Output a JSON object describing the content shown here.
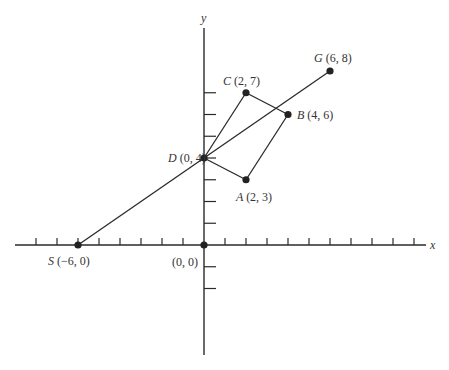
{
  "chart_data": {
    "type": "scatter",
    "title": "",
    "xlabel": "x",
    "ylabel": "y",
    "origin_label": "(0, 0)",
    "xlim": [
      -9,
      10
    ],
    "ylim": [
      -5,
      10
    ],
    "x_ticks": [
      -8,
      -7,
      -6,
      -5,
      -4,
      -3,
      -2,
      -1,
      1,
      2,
      3,
      4,
      5,
      6,
      7,
      8,
      9,
      10
    ],
    "y_ticks": [
      -2,
      -1,
      1,
      2,
      3,
      4,
      5,
      6,
      7
    ],
    "grid": false,
    "points": [
      {
        "name": "S",
        "x": -6,
        "y": 0,
        "label": "(−6, 0)"
      },
      {
        "name": "D",
        "x": 0,
        "y": 4,
        "label": "(0, 4)"
      },
      {
        "name": "A",
        "x": 2,
        "y": 3,
        "label": "(2, 3)"
      },
      {
        "name": "B",
        "x": 4,
        "y": 6,
        "label": "(4, 6)"
      },
      {
        "name": "C",
        "x": 2,
        "y": 7,
        "label": "(2, 7)"
      },
      {
        "name": "G",
        "x": 6,
        "y": 8,
        "label": "(6, 8)"
      },
      {
        "name": "O",
        "x": 0,
        "y": 0,
        "label": ""
      }
    ],
    "segments": [
      {
        "from": "S",
        "to": "G",
        "description": "line from S through D to G"
      },
      {
        "from": "D",
        "to": "A"
      },
      {
        "from": "A",
        "to": "B"
      },
      {
        "from": "B",
        "to": "C"
      },
      {
        "from": "C",
        "to": "D"
      }
    ],
    "shapes": [
      {
        "type": "parallelogram",
        "vertices": [
          "D",
          "A",
          "B",
          "C"
        ]
      }
    ]
  },
  "style": {
    "line_color": "#2a2a2a",
    "point_color": "#222222",
    "label_color": "#333333",
    "background": "#ffffff"
  }
}
